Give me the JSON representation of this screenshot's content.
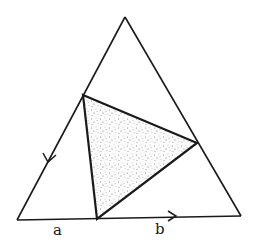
{
  "diagram": {
    "outer_triangle": {
      "apex": [
        125,
        17
      ],
      "bottom_left": [
        17,
        220
      ],
      "bottom_right": [
        241,
        216
      ]
    },
    "inner_triangle": {
      "left": [
        83,
        95
      ],
      "right": [
        197,
        143
      ],
      "bottom": [
        97,
        219
      ],
      "fill": "stippled gray"
    },
    "arrows": [
      {
        "on": "left side",
        "direction": "down-left",
        "at": [
          48,
          158
        ]
      },
      {
        "on": "base",
        "direction": "right",
        "at": [
          172,
          216
        ]
      }
    ],
    "labels": {
      "a": "a",
      "b": "b"
    },
    "colors": {
      "stroke": "#1a1a1a",
      "stipple": "#9a9a9a",
      "background": "#ffffff"
    }
  }
}
